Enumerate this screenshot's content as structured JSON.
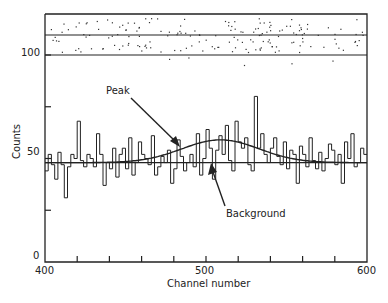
{
  "chart_data": {
    "type": "line",
    "subtype": "histogram-with-fit",
    "title": "",
    "xlabel": "Channel number",
    "ylabel": "Counts",
    "xlim": [
      400,
      600
    ],
    "ylim": [
      0,
      100
    ],
    "x_ticks": [
      400,
      420,
      440,
      460,
      480,
      500,
      520,
      540,
      560,
      580,
      600
    ],
    "x_tick_labels": [
      "400",
      "500",
      "600"
    ],
    "y_ticks": [
      0,
      25,
      50,
      75,
      100
    ],
    "y_tick_labels": [
      "0",
      "50",
      "100"
    ],
    "grid": false,
    "legend": null,
    "annotations": [
      {
        "text": "Peak",
        "points_to": "fitted peak curve near channel 490"
      },
      {
        "text": "Background",
        "points_to": "flat background line near channel 505"
      }
    ],
    "bin_width": 2,
    "series": [
      {
        "name": "Measured counts (histogram)",
        "style": "step",
        "x_start": 400,
        "values": [
          44,
          52,
          47,
          40,
          53,
          47,
          31,
          46,
          52,
          50,
          68,
          49,
          46,
          52,
          50,
          46,
          62,
          52,
          37,
          48,
          45,
          55,
          41,
          52,
          55,
          45,
          60,
          42,
          48,
          58,
          52,
          50,
          47,
          61,
          42,
          46,
          51,
          48,
          54,
          38,
          45,
          59,
          51,
          44,
          48,
          52,
          46,
          62,
          42,
          50,
          64,
          55,
          40,
          54,
          61,
          52,
          66,
          49,
          44,
          68,
          58,
          55,
          60,
          47,
          44,
          80,
          55,
          62,
          52,
          48,
          55,
          60,
          51,
          47,
          58,
          45,
          54,
          52,
          38,
          56,
          52,
          46,
          60,
          49,
          45,
          53,
          44,
          50,
          57,
          54,
          47,
          52,
          38,
          58,
          50,
          62,
          46,
          48,
          55,
          52
        ]
      },
      {
        "name": "Peak fit",
        "style": "smooth",
        "background": 48,
        "amplitude": 11,
        "center": 509,
        "sigma": 24
      },
      {
        "name": "Background",
        "style": "flat",
        "value": 48
      }
    ],
    "residual_panel": {
      "position": "top strip above 100",
      "description": "scattered residual dots in two bands separated by horizontal line"
    }
  },
  "axis": {
    "x_label": "Channel number",
    "y_label": "Counts",
    "x_tick_400": "400",
    "x_tick_500": "500",
    "x_tick_600": "600",
    "y_tick_0": "0",
    "y_tick_50": "50",
    "y_tick_100": "100"
  },
  "annotations": {
    "peak": "Peak",
    "background": "Background"
  }
}
